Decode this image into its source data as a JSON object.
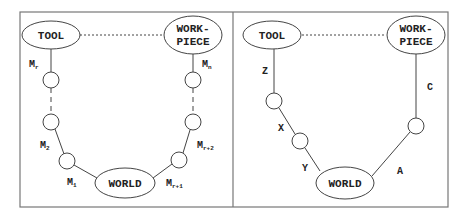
{
  "colors": {
    "stroke": "#444444",
    "frame": "#777777",
    "background": "#ffffff",
    "text": "#222222"
  },
  "left_panel": {
    "tool": "TOOL",
    "workpiece_line1": "WORK-",
    "workpiece_line2": "PIECE",
    "world": "WORLD",
    "labels": {
      "mr": {
        "main": "M",
        "sub": "r"
      },
      "mn": {
        "main": "M",
        "sub": "n"
      },
      "m2": {
        "main": "M",
        "sub": "2"
      },
      "m1": {
        "main": "M",
        "sub": "1"
      },
      "mr1": {
        "main": "M",
        "sub": "r+1"
      },
      "mr2": {
        "main": "M",
        "sub": "r+2"
      }
    }
  },
  "right_panel": {
    "tool": "TOOL",
    "workpiece_line1": "WORK-",
    "workpiece_line2": "PIECE",
    "world": "WORLD",
    "labels": {
      "z": "Z",
      "x": "X",
      "y": "Y",
      "a": "A",
      "c": "C"
    }
  }
}
